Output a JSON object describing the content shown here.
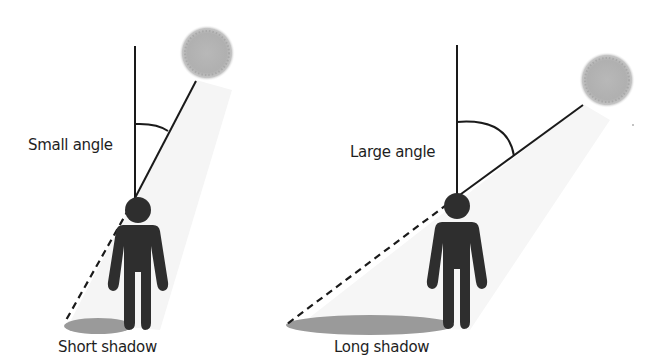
{
  "panels": [
    {
      "id": "left",
      "angle_label": "Small angle",
      "shadow_label": "Short shadow"
    },
    {
      "id": "right",
      "angle_label": "Large angle",
      "shadow_label": "Long shadow"
    }
  ],
  "colors": {
    "line": "#1a1a1a",
    "figure": "#2e2e2e",
    "shadow": "#9a9a9a",
    "sun": "#b4b4b4",
    "light_cone": "#f4f4f4"
  }
}
